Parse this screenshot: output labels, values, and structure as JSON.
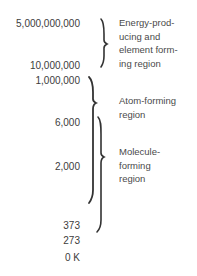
{
  "diagram": {
    "title": "",
    "unit": "K",
    "scale_labels": [
      {
        "text": "5,000,000,000",
        "y": 18
      },
      {
        "text": "10,000,000",
        "y": 60
      },
      {
        "text": "1,000,000",
        "y": 75
      },
      {
        "text": "6,000",
        "y": 117
      },
      {
        "text": "2,000",
        "y": 161
      },
      {
        "text": "373",
        "y": 220
      },
      {
        "text": "273",
        "y": 235
      },
      {
        "text": "0 K",
        "y": 252
      }
    ],
    "regions": [
      {
        "name": "energy-producing-element-forming",
        "lines": [
          "Energy-prod-",
          "ucing and",
          "element form-",
          "ing region"
        ]
      },
      {
        "name": "atom-forming",
        "lines": [
          "Atom-forming",
          "region"
        ]
      },
      {
        "name": "molecule-forming",
        "lines": [
          "Molecule-",
          "forming",
          "region"
        ]
      }
    ],
    "colors": {
      "text": "#3c3c3c",
      "brace": "#333333",
      "background": "#ffffff"
    }
  }
}
